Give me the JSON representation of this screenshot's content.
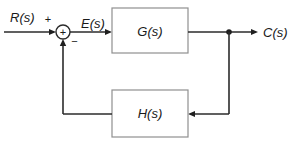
{
  "diagram": {
    "type": "feedback-control-block-diagram",
    "labels": {
      "input_signal": "R(s)",
      "error_signal": "E(s)",
      "forward_block": "G(s)",
      "output_signal": "C(s)",
      "feedback_block": "H(s)",
      "sum_input_sign": "+",
      "sum_feedback_sign": "−",
      "sum_symbol": "+"
    },
    "structure": {
      "summing_junction": {
        "inputs": [
          {
            "signal": "R(s)",
            "sign": "+"
          },
          {
            "signal": "feedback from H(s)",
            "sign": "−"
          }
        ],
        "output": "E(s)"
      },
      "connections": [
        "R(s) → summing junction",
        "summing junction → E(s) → G(s)",
        "G(s) → C(s)",
        "branch point → H(s) → summing junction"
      ]
    },
    "colors": {
      "background": "#ffffff",
      "wire": "#2b2b2b",
      "arrowhead": "#1f1f1f",
      "block_border": "#8f8f8f",
      "block_fill": "#ffffff",
      "text": "#1a1a1a"
    }
  }
}
